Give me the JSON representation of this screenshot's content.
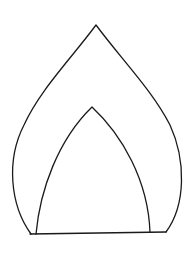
{
  "figure": {
    "stroke_color": "#1a1a1a",
    "background": "#ffffff"
  }
}
